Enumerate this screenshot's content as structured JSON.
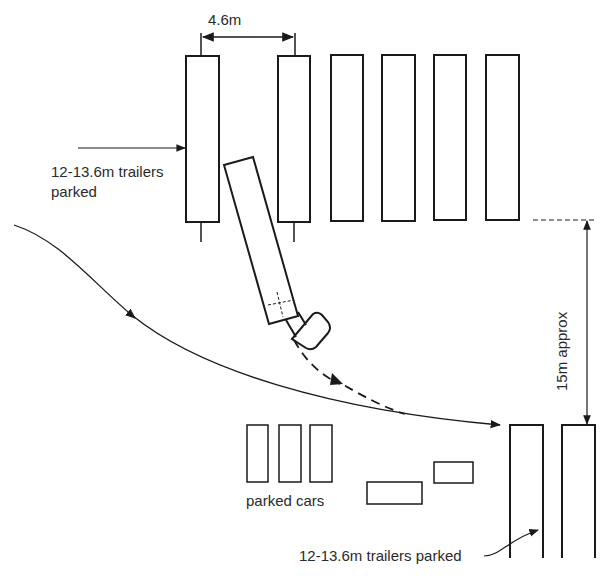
{
  "diagram": {
    "type": "trailer parking layout (plan view)",
    "colors": {
      "line": "#1a1a1a",
      "text": "#2a2a2a",
      "background": "#ffffff"
    },
    "labels": {
      "spacing": "4.6m",
      "trailers_top": "12-13.6m trailers\nparked",
      "trailers_top_line1": "12-13.6m trailers",
      "trailers_top_line2": "parked",
      "aisle_width": "15m approx",
      "parked_cars": "parked cars",
      "trailers_bottom": "12-13.6m trailers parked"
    },
    "top_row_trailers": [
      {
        "x": 186,
        "y": 56,
        "w": 33,
        "h": 166
      },
      {
        "x": 278,
        "y": 56,
        "w": 32,
        "h": 166
      },
      {
        "x": 331,
        "y": 55,
        "w": 32,
        "h": 166
      },
      {
        "x": 382,
        "y": 55,
        "w": 33,
        "h": 166
      },
      {
        "x": 434,
        "y": 55,
        "w": 32,
        "h": 165
      },
      {
        "x": 486,
        "y": 55,
        "w": 33,
        "h": 165
      }
    ],
    "bottom_row_trailers": [
      {
        "x": 510,
        "y": 425,
        "w": 33,
        "h": 153
      },
      {
        "x": 562,
        "y": 425,
        "w": 33,
        "h": 153
      }
    ],
    "parked_cars": [
      {
        "x": 247,
        "y": 425,
        "w": 21,
        "h": 57
      },
      {
        "x": 279,
        "y": 425,
        "w": 22,
        "h": 57
      },
      {
        "x": 310,
        "y": 425,
        "w": 22,
        "h": 57
      },
      {
        "x": 367,
        "y": 482,
        "w": 55,
        "h": 22
      },
      {
        "x": 434,
        "y": 462,
        "w": 39,
        "h": 21
      }
    ],
    "manoeuvring_vehicle": "articulated truck reversing into bay",
    "paths": [
      {
        "name": "approach-path",
        "style": "solid"
      },
      {
        "name": "reverse-path",
        "style": "dashed"
      }
    ]
  }
}
